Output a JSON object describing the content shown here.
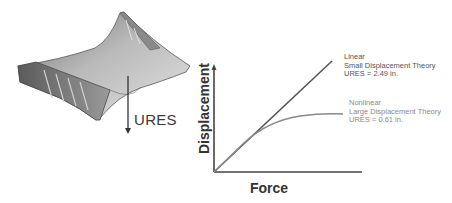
{
  "figure": {
    "model_label": "URES",
    "chart": {
      "ylabel": "Displacement",
      "xlabel": "Force",
      "linear": {
        "line1": "Linear",
        "line2": "Small Displacement Theory",
        "line3": "URES = 2.49 in."
      },
      "nonlinear": {
        "line1": "Nonlinear",
        "line2": "Large Displacement Theory",
        "line3": "URES = 0.61 in."
      }
    }
  },
  "colors": {
    "linear_line": "#555555",
    "nonlinear_line": "#8a8a8a",
    "axes": "#444444"
  }
}
